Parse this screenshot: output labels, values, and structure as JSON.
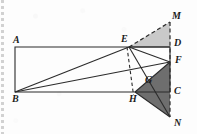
{
  "figure": {
    "kind": "geometry-diagram",
    "canvas": {
      "width": 197,
      "height": 134
    },
    "colors": {
      "background": "#fdfdfd",
      "stroke": "#2b2b2b",
      "light_shade": "#c9c9c9",
      "dark_shade": "#6e6e6e",
      "label": "#1b1b1b"
    },
    "points": {
      "A": {
        "x": 15,
        "y": 47,
        "label": "A",
        "label_x": 13,
        "label_y": 35
      },
      "B": {
        "x": 15,
        "y": 92,
        "label": "B",
        "label_x": 12,
        "label_y": 94
      },
      "C": {
        "x": 170,
        "y": 92,
        "label": "C",
        "label_x": 174,
        "label_y": 86
      },
      "D": {
        "x": 170,
        "y": 47,
        "label": "D",
        "label_x": 174,
        "label_y": 38
      },
      "E": {
        "x": 129,
        "y": 47,
        "label": "E",
        "label_x": 122,
        "label_y": 35
      },
      "F": {
        "x": 170,
        "y": 62,
        "label": "F",
        "label_x": 175,
        "label_y": 56
      },
      "G": {
        "x": 151,
        "y": 74,
        "label": "G",
        "label_x": 146,
        "label_y": 76
      },
      "H": {
        "x": 135,
        "y": 92,
        "label": "H",
        "label_x": 130,
        "label_y": 95
      },
      "M": {
        "x": 170,
        "y": 22,
        "label": "M",
        "label_x": 173,
        "label_y": 12
      },
      "N": {
        "x": 170,
        "y": 117,
        "label": "N",
        "label_x": 174,
        "label_y": 118
      }
    },
    "rectangle": {
      "name": "rectangle-ABCD",
      "vertices": "15,47 170,47 170,92 15,92"
    },
    "solid_segments": [
      {
        "name": "segment-BE",
        "x1": 15,
        "y1": 92,
        "x2": 129,
        "y2": 47
      },
      {
        "name": "segment-BF",
        "x1": 15,
        "y1": 92,
        "x2": 170,
        "y2": 62
      },
      {
        "name": "segment-ED",
        "x1": 129,
        "y1": 47,
        "x2": 170,
        "y2": 47
      },
      {
        "name": "segment-EF",
        "x1": 129,
        "y1": 47,
        "x2": 170,
        "y2": 62
      },
      {
        "name": "segment-EN",
        "x1": 129,
        "y1": 47,
        "x2": 170,
        "y2": 117
      },
      {
        "name": "segment-EH",
        "x1": 129,
        "y1": 47,
        "x2": 135,
        "y2": 92
      },
      {
        "name": "segment-HF",
        "x1": 135,
        "y1": 92,
        "x2": 170,
        "y2": 62
      },
      {
        "name": "segment-HN",
        "x1": 135,
        "y1": 92,
        "x2": 170,
        "y2": 117
      }
    ],
    "dashed_segments": [
      {
        "name": "segment-EM-dashed",
        "x1": 129,
        "y1": 47,
        "x2": 170,
        "y2": 22
      },
      {
        "name": "segment-MN-dashed",
        "x1": 170,
        "y1": 22,
        "x2": 170,
        "y2": 117
      },
      {
        "name": "segment-EH-dashed",
        "x1": 127,
        "y1": 47,
        "x2": 133,
        "y2": 94
      }
    ],
    "shaded_regions": [
      {
        "name": "triangle-EMD-light",
        "points": "129,47 170,22 170,47",
        "fill": "#c9c9c9"
      },
      {
        "name": "triangle-HFN-dark",
        "points": "135,92 170,62 170,117",
        "fill": "#6e6e6e"
      }
    ]
  }
}
